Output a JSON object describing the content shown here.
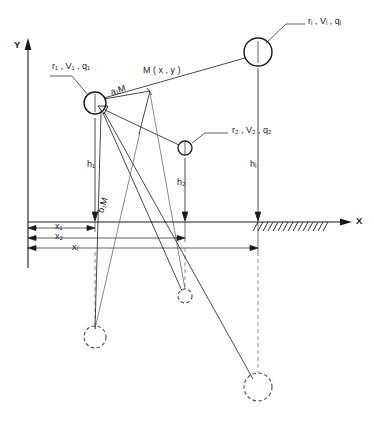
{
  "figure": {
    "type": "technical-diagram"
  },
  "axes": {
    "y_label": "Y",
    "x_label": "X",
    "origin_x": 28,
    "ground_y": 222
  },
  "conductors": [
    {
      "id": "1",
      "inner_label": "1",
      "param_label": "r₁ , V₁ , q₁",
      "cx": 95,
      "cy": 103,
      "r": 11
    },
    {
      "id": "2",
      "inner_label": "2",
      "param_label": "r₂ , V₂ , q₂",
      "cx": 185,
      "cy": 148,
      "r": 7
    },
    {
      "id": "i",
      "inner_label": "i",
      "param_label": "rᵢ , Vᵢ , qᵢ",
      "cx": 258,
      "cy": 52,
      "r": 14
    }
  ],
  "images": [
    {
      "id": "1'",
      "cx": 95,
      "cy": 337,
      "r": 11
    },
    {
      "id": "2'",
      "cx": 185,
      "cy": 296,
      "r": 7
    },
    {
      "id": "i'",
      "cx": 258,
      "cy": 387,
      "r": 14
    }
  ],
  "point_m": {
    "label": "M ( x , y )",
    "x": 150,
    "y": 91
  },
  "distances": {
    "a1M": "a₁M",
    "b1M": "b₁M"
  },
  "heights": [
    {
      "label": "h₁",
      "x": 95,
      "value_text": "h₁"
    },
    {
      "label": "h₂",
      "x": 185,
      "value_text": "h₂"
    },
    {
      "label": "hᵢ",
      "x": 258,
      "value_text": "hᵢ"
    }
  ],
  "horizontal_distances": [
    {
      "label": "x₁",
      "to_x": 95
    },
    {
      "label": "x₂",
      "to_x": 185
    },
    {
      "label": "xᵢ",
      "to_x": 258
    }
  ],
  "ground": {
    "hatch_start_x": 258,
    "hatch_end_x": 330,
    "hatch_count": 14
  },
  "colors": {
    "line": "#1a1a1a",
    "thin_line": "#555555",
    "dashed": "#777777",
    "background": "#ffffff"
  }
}
